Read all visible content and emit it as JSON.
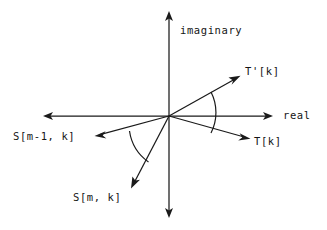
{
  "figure": {
    "kind": "complex-plane-phasor-diagram",
    "background_color": "#ffffff",
    "stroke_color": "#1a1a1a",
    "text_color": "#151515",
    "width": 327,
    "height": 230,
    "origin": {
      "x": 169,
      "y": 116
    }
  },
  "axes": {
    "real": {
      "label": "real",
      "label_x": 283,
      "label_y": 110,
      "x1": 44,
      "y1": 116,
      "x2": 272,
      "y2": 116,
      "arrow_both_ends": true
    },
    "imaginary": {
      "label": "imaginary",
      "label_x": 180,
      "label_y": 25,
      "x1": 169,
      "y1": 12,
      "x2": 169,
      "y2": 217,
      "arrow_both_ends": true
    }
  },
  "vectors": [
    {
      "name": "t-prime-k",
      "label": "T'[k]",
      "x1": 169,
      "y1": 116,
      "x2": 240,
      "y2": 76,
      "label_x": 245,
      "label_y": 66
    },
    {
      "name": "t-k",
      "label": "T[k]",
      "x1": 169,
      "y1": 116,
      "x2": 250,
      "y2": 139,
      "label_x": 254,
      "label_y": 136
    },
    {
      "name": "s-m-minus-1-k",
      "label": "S[m-1, k]",
      "x1": 169,
      "y1": 116,
      "x2": 95,
      "y2": 136,
      "label_x": 13,
      "label_y": 131
    },
    {
      "name": "s-m-k",
      "label": "S[m, k]",
      "x1": 169,
      "y1": 116,
      "x2": 131,
      "y2": 188,
      "label_x": 73,
      "label_y": 192
    }
  ],
  "angle_arcs": [
    {
      "name": "angle-between-t-and-t-prime",
      "radius": 45,
      "start_x": 211,
      "start_y": 92,
      "end_x": 211,
      "end_y": 133,
      "sweep": 1
    },
    {
      "name": "angle-between-s-vectors",
      "radius": 46,
      "start_x": 129,
      "start_y": 131,
      "end_x": 148,
      "end_y": 162,
      "sweep": 0
    }
  ]
}
